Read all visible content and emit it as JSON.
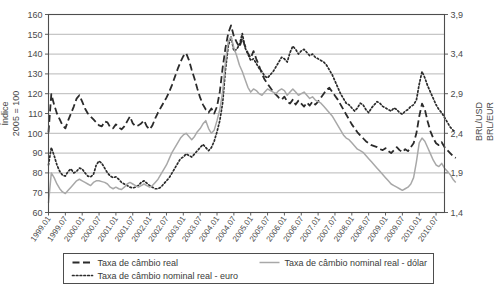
{
  "chart_data": {
    "type": "line",
    "title": "",
    "xlabel": "",
    "ylabel": "Índice\n2005 = 100",
    "ylabel_line1": "Índice",
    "ylabel_line2": "2005 = 100",
    "y2label_line1": "BRL/USD",
    "y2label_line2": "BRL/EUR",
    "ylim": [
      60,
      160
    ],
    "y2lim": [
      1.4,
      3.9
    ],
    "yticks": [
      60,
      70,
      80,
      90,
      100,
      110,
      120,
      130,
      140,
      150,
      160
    ],
    "ytick_labels": [
      "60",
      "70",
      "80",
      "90",
      "100",
      "110",
      "120",
      "130",
      "140",
      "150",
      "160"
    ],
    "y2ticks": [
      1.4,
      1.9,
      2.4,
      2.9,
      3.4,
      3.9
    ],
    "y2tick_labels": [
      "1,4",
      "1,9",
      "2,4",
      "2,9",
      "3,4",
      "3,9"
    ],
    "grid": true,
    "legend_position": "bottom",
    "xtick_labels": [
      "1999.01",
      "1999.07",
      "2000.01",
      "2000.07",
      "2001.01",
      "2001.07",
      "2002.01",
      "2002.07",
      "2003.01",
      "2003.07",
      "2004.01",
      "2004.07",
      "2005.01",
      "2005.07",
      "2006.01",
      "2006.07",
      "2007.01",
      "2007.07",
      "2008.01",
      "2008.07",
      "2009.01",
      "2009.07",
      "2010.01",
      "2010.07"
    ],
    "x_start": "1999.01",
    "x_end": "2010.10",
    "n_points": 142,
    "series": [
      {
        "name": "Taxa de câmbio real",
        "style": "dashed",
        "color": "#2b2b2b",
        "axis": "left",
        "values": [
          100.5,
          119.8,
          114.5,
          110.0,
          107.0,
          104.0,
          102.5,
          106.5,
          110.0,
          113.5,
          117.5,
          119.2,
          116.0,
          112.5,
          110.0,
          108.5,
          107.0,
          105.5,
          104.0,
          103.5,
          106.0,
          105.5,
          103.0,
          102.5,
          104.5,
          103.0,
          102.0,
          103.5,
          106.0,
          108.5,
          105.0,
          103.5,
          104.0,
          105.0,
          106.5,
          103.5,
          102.0,
          104.0,
          107.5,
          110.5,
          113.0,
          115.5,
          118.0,
          121.0,
          124.5,
          128.5,
          132.5,
          136.0,
          139.0,
          140.5,
          137.0,
          132.0,
          127.5,
          122.5,
          118.0,
          114.5,
          112.0,
          110.5,
          112.5,
          110.0,
          113.5,
          121.0,
          133.0,
          143.0,
          150.5,
          154.5,
          149.0,
          146.0,
          143.5,
          148.0,
          144.0,
          140.5,
          138.0,
          141.5,
          137.5,
          134.0,
          130.0,
          127.0,
          125.0,
          123.0,
          121.0,
          119.5,
          118.0,
          117.0,
          118.5,
          116.0,
          115.0,
          117.0,
          114.5,
          116.5,
          115.0,
          113.5,
          115.5,
          114.0,
          116.0,
          114.5,
          116.0,
          118.0,
          120.0,
          122.0,
          123.0,
          121.0,
          119.0,
          117.0,
          114.5,
          112.0,
          109.5,
          107.0,
          104.5,
          102.5,
          100.5,
          99.0,
          97.5,
          96.0,
          95.0,
          94.0,
          93.5,
          93.0,
          92.0,
          91.5,
          92.5,
          91.0,
          90.0,
          91.5,
          93.0,
          91.5,
          90.5,
          92.0,
          91.0,
          93.0,
          95.0,
          100.0,
          108.5,
          115.0,
          112.0,
          106.0,
          101.0,
          97.5,
          95.0,
          94.0,
          95.5,
          93.0,
          91.5,
          90.0,
          88.5,
          87.5
        ]
      },
      {
        "name": "Taxa de câmbio nominal real - euro",
        "style": "dotted",
        "color": "#2b2b2b",
        "axis": "right",
        "values": [
          2.0,
          2.22,
          2.12,
          2.0,
          1.92,
          1.87,
          1.86,
          1.92,
          1.95,
          1.9,
          1.92,
          1.96,
          1.95,
          1.9,
          1.86,
          1.85,
          1.88,
          2.0,
          2.05,
          2.02,
          1.96,
          1.9,
          1.86,
          1.84,
          1.85,
          1.82,
          1.78,
          1.76,
          1.74,
          1.72,
          1.71,
          1.72,
          1.74,
          1.78,
          1.8,
          1.77,
          1.74,
          1.72,
          1.7,
          1.7,
          1.72,
          1.76,
          1.8,
          1.84,
          1.9,
          1.96,
          2.02,
          2.08,
          2.1,
          2.14,
          2.12,
          2.1,
          2.14,
          2.18,
          2.22,
          2.26,
          2.22,
          2.18,
          2.22,
          2.3,
          2.42,
          2.56,
          2.78,
          3.2,
          3.5,
          3.62,
          3.44,
          3.46,
          3.52,
          3.66,
          3.48,
          3.4,
          3.32,
          3.34,
          3.28,
          3.22,
          3.18,
          3.12,
          3.1,
          3.14,
          3.18,
          3.24,
          3.3,
          3.36,
          3.34,
          3.3,
          3.42,
          3.5,
          3.46,
          3.4,
          3.44,
          3.46,
          3.42,
          3.38,
          3.4,
          3.36,
          3.34,
          3.32,
          3.3,
          3.26,
          3.2,
          3.14,
          3.06,
          2.98,
          2.9,
          2.84,
          2.78,
          2.76,
          2.72,
          2.68,
          2.72,
          2.78,
          2.76,
          2.7,
          2.66,
          2.72,
          2.76,
          2.8,
          2.78,
          2.74,
          2.72,
          2.7,
          2.68,
          2.72,
          2.7,
          2.66,
          2.64,
          2.68,
          2.7,
          2.74,
          2.76,
          2.82,
          3.02,
          3.18,
          3.1,
          3.0,
          2.92,
          2.84,
          2.76,
          2.7,
          2.66,
          2.6,
          2.54,
          2.48,
          2.44,
          2.42
        ]
      },
      {
        "name": "Taxa de câmbio nominal real - dólar",
        "style": "solid",
        "color": "#a8a8a8",
        "axis": "right",
        "values": [
          1.52,
          1.9,
          1.84,
          1.76,
          1.7,
          1.66,
          1.64,
          1.68,
          1.72,
          1.76,
          1.8,
          1.82,
          1.8,
          1.78,
          1.76,
          1.74,
          1.78,
          1.8,
          1.8,
          1.79,
          1.78,
          1.76,
          1.72,
          1.7,
          1.72,
          1.7,
          1.69,
          1.72,
          1.76,
          1.78,
          1.76,
          1.74,
          1.72,
          1.74,
          1.76,
          1.74,
          1.72,
          1.74,
          1.78,
          1.82,
          1.88,
          1.94,
          2.0,
          2.08,
          2.16,
          2.22,
          2.28,
          2.34,
          2.38,
          2.4,
          2.36,
          2.32,
          2.36,
          2.42,
          2.46,
          2.52,
          2.56,
          2.46,
          2.4,
          2.44,
          2.56,
          2.7,
          2.92,
          3.3,
          3.56,
          3.62,
          3.48,
          3.38,
          3.26,
          3.18,
          3.08,
          2.98,
          2.92,
          2.96,
          2.94,
          2.9,
          2.88,
          2.92,
          2.96,
          2.94,
          2.92,
          2.9,
          2.94,
          2.96,
          2.94,
          2.88,
          2.92,
          2.96,
          2.92,
          2.88,
          2.9,
          2.92,
          2.88,
          2.84,
          2.86,
          2.82,
          2.8,
          2.78,
          2.74,
          2.7,
          2.66,
          2.62,
          2.56,
          2.5,
          2.44,
          2.38,
          2.34,
          2.32,
          2.28,
          2.24,
          2.2,
          2.18,
          2.16,
          2.12,
          2.08,
          2.04,
          2.0,
          1.96,
          1.92,
          1.88,
          1.84,
          1.8,
          1.76,
          1.74,
          1.72,
          1.7,
          1.68,
          1.7,
          1.72,
          1.76,
          1.84,
          2.04,
          2.28,
          2.34,
          2.3,
          2.22,
          2.14,
          2.06,
          2.0,
          1.98,
          2.02,
          1.96,
          1.92,
          1.88,
          1.82,
          1.78
        ]
      }
    ]
  }
}
